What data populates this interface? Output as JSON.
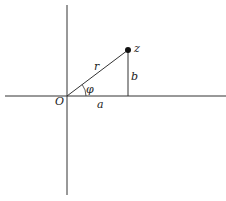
{
  "diagram": {
    "labels": {
      "origin": "O",
      "point": "z",
      "radius": "r",
      "angle": "φ",
      "real": "a",
      "imag": "b"
    },
    "colors": {
      "line": "#333333",
      "point": "#111111",
      "background": "#ffffff"
    }
  }
}
